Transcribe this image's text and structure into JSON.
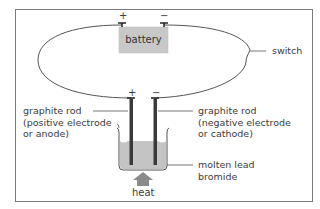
{
  "diagram": {
    "battery": {
      "label": "battery",
      "positive": "+",
      "negative": "−",
      "fill": "#c8c8c8"
    },
    "switch": {
      "label": "switch"
    },
    "electrodes": {
      "positive_terminal": "+",
      "negative_terminal": "−",
      "anode": {
        "line1": "graphite rod",
        "line2": "(positive electrode",
        "line3": "or anode)"
      },
      "cathode": {
        "line1": "graphite rod",
        "line2": "(negative electrode",
        "line3": "or cathode)"
      }
    },
    "electrolyte": {
      "line1": "molten lead",
      "line2": "bromide",
      "fill": "#c4c4c4"
    },
    "heat": {
      "label": "heat",
      "arrow_fill": "#8a8a8a"
    },
    "colors": {
      "wire": "#555555",
      "rod": "#3a3a3a",
      "frame": "#7a7a7a"
    }
  }
}
